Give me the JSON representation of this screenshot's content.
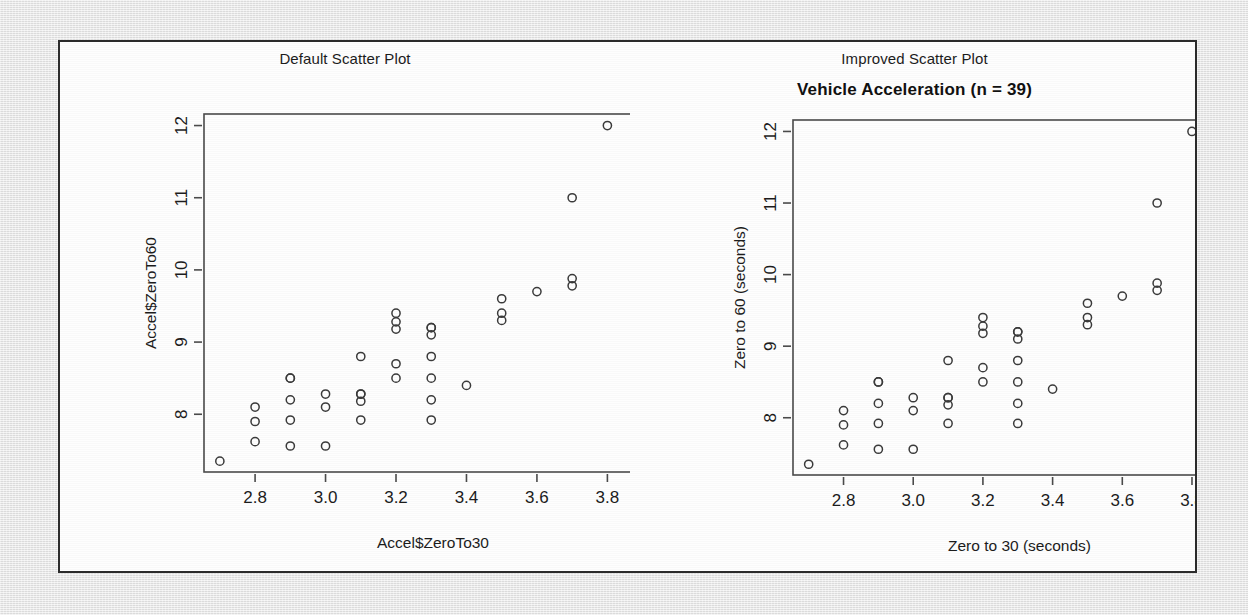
{
  "figure": {
    "left_panel_heading": "Default Scatter Plot",
    "right_panel_heading": "Improved Scatter Plot",
    "right_main_title": "Vehicle Acceleration (n = 39)"
  },
  "chart_data": [
    {
      "id": "default-scatter",
      "type": "scatter",
      "title": "Default Scatter Plot",
      "main_title": "",
      "xlabel": "Accel$ZeroTo30",
      "ylabel": "Accel$ZeroTo60",
      "xlim": [
        2.655,
        3.955
      ],
      "ylim": [
        7.2,
        12.16
      ],
      "xticks": [
        2.8,
        3.0,
        3.2,
        3.4,
        3.6,
        3.8
      ],
      "xticklabels": [
        "2.8",
        "3.0",
        "3.2",
        "3.4",
        "3.6",
        "3.8"
      ],
      "yticks": [
        8,
        9,
        10,
        11,
        12
      ],
      "yticklabels": [
        "8",
        "9",
        "10",
        "11",
        "12"
      ],
      "grid": false,
      "legend": "none",
      "marker": "open-circle",
      "marker_color": "#3a3a3a",
      "n": 39,
      "x": [
        2.7,
        2.8,
        2.8,
        2.8,
        2.9,
        2.9,
        2.9,
        2.9,
        3.0,
        3.0,
        3.0,
        3.1,
        3.1,
        3.1,
        3.1,
        3.2,
        3.2,
        3.2,
        3.2,
        3.2,
        3.3,
        3.3,
        3.3,
        3.3,
        3.3,
        3.3,
        3.4,
        3.5,
        3.5,
        3.5,
        3.6,
        3.7,
        3.7,
        3.7,
        3.8,
        3.9,
        2.9,
        3.1,
        3.3
      ],
      "y": [
        7.35,
        8.1,
        7.9,
        7.62,
        8.5,
        8.2,
        7.92,
        7.56,
        8.28,
        8.1,
        7.56,
        8.8,
        8.28,
        8.18,
        7.92,
        9.4,
        9.28,
        9.18,
        8.7,
        8.5,
        9.2,
        9.1,
        8.8,
        8.5,
        8.2,
        7.92,
        8.4,
        9.6,
        9.4,
        9.3,
        9.7,
        11.0,
        9.88,
        9.78,
        12.0,
        10.5,
        8.5,
        8.28,
        9.2
      ]
    },
    {
      "id": "improved-scatter",
      "type": "scatter",
      "title": "Improved Scatter Plot",
      "main_title": "Vehicle Acceleration (n = 39)",
      "xlabel": "Zero to 30 (seconds)",
      "ylabel": "Zero to 60 (seconds)",
      "xlim": [
        2.655,
        3.955
      ],
      "ylim": [
        7.2,
        12.16
      ],
      "xticks": [
        2.8,
        3.0,
        3.2,
        3.4,
        3.6,
        3.8
      ],
      "xticklabels": [
        "2.8",
        "3.0",
        "3.2",
        "3.4",
        "3.6",
        "3.8"
      ],
      "yticks": [
        8,
        9,
        10,
        11,
        12
      ],
      "yticklabels": [
        "8",
        "9",
        "10",
        "11",
        "12"
      ],
      "grid": false,
      "legend": "none",
      "marker": "open-circle",
      "marker_color": "#3a3a3a",
      "n": 39,
      "x": [
        2.7,
        2.8,
        2.8,
        2.8,
        2.9,
        2.9,
        2.9,
        2.9,
        3.0,
        3.0,
        3.0,
        3.1,
        3.1,
        3.1,
        3.1,
        3.2,
        3.2,
        3.2,
        3.2,
        3.2,
        3.3,
        3.3,
        3.3,
        3.3,
        3.3,
        3.3,
        3.4,
        3.5,
        3.5,
        3.5,
        3.6,
        3.7,
        3.7,
        3.7,
        3.8,
        3.9,
        2.9,
        3.1,
        3.3
      ],
      "y": [
        7.35,
        8.1,
        7.9,
        7.62,
        8.5,
        8.2,
        7.92,
        7.56,
        8.28,
        8.1,
        7.56,
        8.8,
        8.28,
        8.18,
        7.92,
        9.4,
        9.28,
        9.18,
        8.7,
        8.5,
        9.2,
        9.1,
        8.8,
        8.5,
        8.2,
        7.92,
        8.4,
        9.6,
        9.4,
        9.3,
        9.7,
        11.0,
        9.88,
        9.78,
        12.0,
        10.5,
        8.5,
        8.28,
        9.2
      ]
    }
  ],
  "colors": {
    "panel_background": "#fdfdfd",
    "panel_border": "#2b2b2b",
    "page_background": "#e8e8e8",
    "axis": "#4a4a4a",
    "text": "#1c1c1c"
  }
}
